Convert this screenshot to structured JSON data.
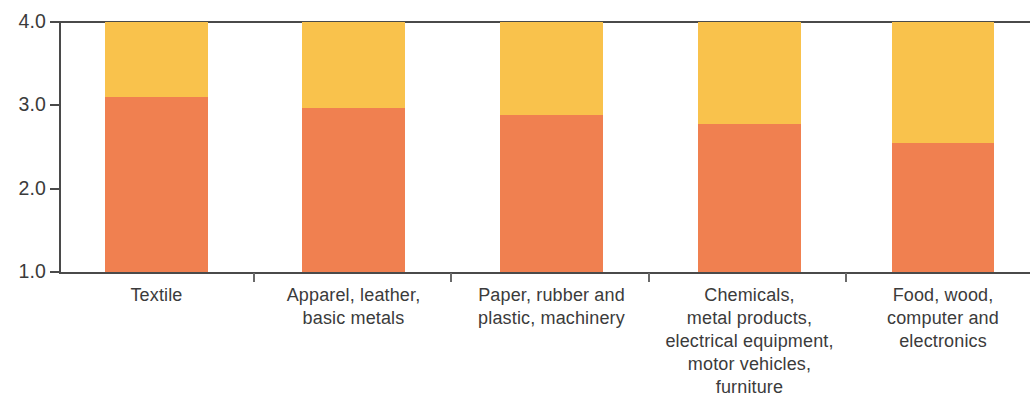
{
  "chart_data": {
    "type": "bar",
    "stacked": true,
    "title": "",
    "subtitle": "",
    "xlabel": "",
    "ylabel": "",
    "ylim": [
      1.0,
      4.0
    ],
    "ytick_labels": [
      "4.0",
      "3.0",
      "2.0",
      "1.0"
    ],
    "ytick_values": [
      4.0,
      3.0,
      2.0,
      1.0
    ],
    "grid": false,
    "legend": null,
    "categories": [
      "Textile",
      "Apparel, leather, basic metals",
      "Paper, rubber and plastic, machinery",
      "Chemicals, metal products, electrical equipment, motor vehicles, furniture",
      "Food, wood, computer and electronics"
    ],
    "category_label_lines": [
      [
        "Textile"
      ],
      [
        "Apparel, leather,",
        "basic metals"
      ],
      [
        "Paper, rubber and",
        "plastic, machinery"
      ],
      [
        "Chemicals,",
        "metal products,",
        "electrical equipment,",
        "motor vehicles,",
        "furniture"
      ],
      [
        "Food, wood,",
        "computer and",
        "electronics"
      ]
    ],
    "series": [
      {
        "name": "lower-segment",
        "color": "#F08050",
        "values": [
          3.1,
          2.97,
          2.88,
          2.78,
          2.55
        ]
      },
      {
        "name": "upper-segment",
        "color": "#F9C24C",
        "values": [
          0.9,
          1.03,
          1.12,
          1.22,
          1.45
        ]
      }
    ],
    "segment_tops": [
      4.0,
      4.0,
      4.0,
      4.0,
      4.0
    ],
    "axis_color": "#4a4a4a"
  },
  "colors": {
    "lower": "#F08050",
    "upper": "#F9C24C",
    "axis": "#4a4a4a",
    "text": "#3b3b3b",
    "background": "#ffffff"
  }
}
